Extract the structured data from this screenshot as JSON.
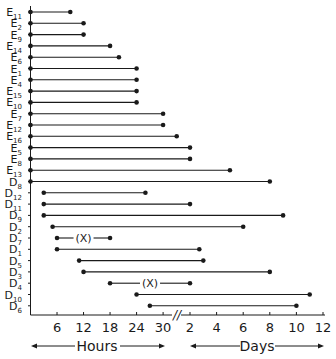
{
  "chart_data": {
    "type": "range-dot",
    "title": "",
    "xlabel_left": "Hours",
    "xlabel_right": "Days",
    "x_axis": {
      "segments": [
        {
          "unit": "hours",
          "ticks": [
            6,
            12,
            18,
            24,
            30
          ],
          "range": [
            0,
            32
          ]
        },
        {
          "unit": "days",
          "ticks": [
            2,
            4,
            6,
            8,
            10,
            12
          ],
          "range": [
            1,
            12
          ]
        }
      ],
      "break_symbol": "//"
    },
    "categories": [
      "E11",
      "E2",
      "E9",
      "E14",
      "E6",
      "E1",
      "E4",
      "E15",
      "E10",
      "E7",
      "E12",
      "E16",
      "E5",
      "E8",
      "E13",
      "D8",
      "D12",
      "D11",
      "D9",
      "D2",
      "D7",
      "D1",
      "D5",
      "D3",
      "D4",
      "D10",
      "D6"
    ],
    "labels": [
      {
        "main": "E",
        "sub": "11"
      },
      {
        "main": "E",
        "sub": "2"
      },
      {
        "main": "E",
        "sub": "9"
      },
      {
        "main": "E",
        "sub": "14"
      },
      {
        "main": "E",
        "sub": "6"
      },
      {
        "main": "E",
        "sub": "1"
      },
      {
        "main": "E",
        "sub": "4"
      },
      {
        "main": "E",
        "sub": "15"
      },
      {
        "main": "E",
        "sub": "10"
      },
      {
        "main": "E",
        "sub": "7"
      },
      {
        "main": "E",
        "sub": "12"
      },
      {
        "main": "E",
        "sub": "16"
      },
      {
        "main": "E",
        "sub": "5"
      },
      {
        "main": "E",
        "sub": "8"
      },
      {
        "main": "E",
        "sub": "13"
      },
      {
        "main": "D",
        "sub": "8"
      },
      {
        "main": "D",
        "sub": "12"
      },
      {
        "main": "D",
        "sub": "11"
      },
      {
        "main": "D",
        "sub": "9"
      },
      {
        "main": "D",
        "sub": "2"
      },
      {
        "main": "D",
        "sub": "7"
      },
      {
        "main": "D",
        "sub": "1"
      },
      {
        "main": "D",
        "sub": "5"
      },
      {
        "main": "D",
        "sub": "3"
      },
      {
        "main": "D",
        "sub": "4"
      },
      {
        "main": "D",
        "sub": "10"
      },
      {
        "main": "D",
        "sub": "6"
      }
    ],
    "series": [
      {
        "name": "E11",
        "start": {
          "unit": "h",
          "v": 0
        },
        "end": {
          "unit": "h",
          "v": 9
        }
      },
      {
        "name": "E2",
        "start": {
          "unit": "h",
          "v": 0
        },
        "end": {
          "unit": "h",
          "v": 12
        }
      },
      {
        "name": "E9",
        "start": {
          "unit": "h",
          "v": 0
        },
        "end": {
          "unit": "h",
          "v": 12
        }
      },
      {
        "name": "E14",
        "start": {
          "unit": "h",
          "v": 0
        },
        "end": {
          "unit": "h",
          "v": 18
        }
      },
      {
        "name": "E6",
        "start": {
          "unit": "h",
          "v": 0
        },
        "end": {
          "unit": "h",
          "v": 20
        }
      },
      {
        "name": "E1",
        "start": {
          "unit": "h",
          "v": 0
        },
        "end": {
          "unit": "h",
          "v": 24
        }
      },
      {
        "name": "E4",
        "start": {
          "unit": "h",
          "v": 0
        },
        "end": {
          "unit": "h",
          "v": 24
        }
      },
      {
        "name": "E15",
        "start": {
          "unit": "h",
          "v": 0
        },
        "end": {
          "unit": "h",
          "v": 24
        }
      },
      {
        "name": "E10",
        "start": {
          "unit": "h",
          "v": 0
        },
        "end": {
          "unit": "h",
          "v": 24
        }
      },
      {
        "name": "E7",
        "start": {
          "unit": "h",
          "v": 0
        },
        "end": {
          "unit": "h",
          "v": 30
        }
      },
      {
        "name": "E12",
        "start": {
          "unit": "h",
          "v": 0
        },
        "end": {
          "unit": "h",
          "v": 30
        }
      },
      {
        "name": "E16",
        "start": {
          "unit": "h",
          "v": 0
        },
        "end": {
          "unit": "d",
          "v": 1
        }
      },
      {
        "name": "E5",
        "start": {
          "unit": "h",
          "v": 0
        },
        "end": {
          "unit": "d",
          "v": 2
        }
      },
      {
        "name": "E8",
        "start": {
          "unit": "h",
          "v": 0
        },
        "end": {
          "unit": "d",
          "v": 2
        }
      },
      {
        "name": "E13",
        "start": {
          "unit": "h",
          "v": 0
        },
        "end": {
          "unit": "d",
          "v": 5
        }
      },
      {
        "name": "D8",
        "start": {
          "unit": "h",
          "v": 0
        },
        "end": {
          "unit": "d",
          "v": 8
        }
      },
      {
        "name": "D12",
        "start": {
          "unit": "h",
          "v": 3
        },
        "end": {
          "unit": "h",
          "v": 26
        }
      },
      {
        "name": "D11",
        "start": {
          "unit": "h",
          "v": 3
        },
        "end": {
          "unit": "d",
          "v": 2
        }
      },
      {
        "name": "D9",
        "start": {
          "unit": "h",
          "v": 3
        },
        "end": {
          "unit": "d",
          "v": 9
        }
      },
      {
        "name": "D2",
        "start": {
          "unit": "h",
          "v": 5
        },
        "end": {
          "unit": "d",
          "v": 6
        }
      },
      {
        "name": "D7",
        "start": {
          "unit": "h",
          "v": 6
        },
        "end": {
          "unit": "h",
          "v": 18
        },
        "marker": "(X)"
      },
      {
        "name": "D1",
        "start": {
          "unit": "h",
          "v": 6
        },
        "end": {
          "unit": "d",
          "v": 2.7
        }
      },
      {
        "name": "D5",
        "start": {
          "unit": "h",
          "v": 11
        },
        "end": {
          "unit": "d",
          "v": 3
        }
      },
      {
        "name": "D3",
        "start": {
          "unit": "h",
          "v": 12
        },
        "end": {
          "unit": "d",
          "v": 8
        }
      },
      {
        "name": "D4",
        "start": {
          "unit": "h",
          "v": 18
        },
        "end": {
          "unit": "d",
          "v": 2
        },
        "marker": "(X)"
      },
      {
        "name": "D10",
        "start": {
          "unit": "h",
          "v": 24
        },
        "end": {
          "unit": "d",
          "v": 11
        }
      },
      {
        "name": "D6",
        "start": {
          "unit": "h",
          "v": 27
        },
        "end": {
          "unit": "d",
          "v": 10
        }
      }
    ],
    "grid": false,
    "legend": null
  },
  "axis_labels": {
    "hours": "Hours",
    "days": "Days",
    "break": "//"
  },
  "colors": {
    "ink": "#1a1a1a",
    "background": "#ffffff"
  }
}
